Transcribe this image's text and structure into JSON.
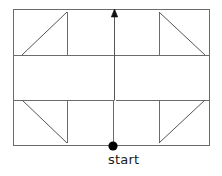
{
  "figure": {
    "kind": "path-diagram",
    "title": "",
    "colors": {
      "stroke": "#6b6b6b",
      "diagonal_stroke": "#555555",
      "marker": "#000000",
      "text": "#1a1a1a",
      "background": "#ffffff"
    },
    "stroke_width": 1,
    "canvas": {
      "width": 222,
      "height": 176
    },
    "bounds": {
      "left": 13,
      "top": 9,
      "right": 210,
      "bottom": 146
    },
    "guides": {
      "upper_horizontal_y": 55,
      "lower_horizontal_y": 100,
      "upper_vertical_x": 114,
      "lower_vertical_x": 113,
      "step_gap_x": 116
    },
    "segments": [
      {
        "name": "outer-rectangle",
        "x": 13,
        "y": 9,
        "width": 197,
        "height": 137
      },
      {
        "name": "upper-horizontal",
        "x1": 13,
        "y1": 55,
        "x2": 210,
        "y2": 55
      },
      {
        "name": "lower-horizontal-left",
        "x1": 13,
        "y1": 100,
        "x2": 114,
        "y2": 100
      },
      {
        "name": "lower-horizontal-right",
        "x1": 116,
        "y1": 100,
        "x2": 210,
        "y2": 100
      },
      {
        "name": "central-vertical-upper",
        "x1": 114,
        "y1": 14,
        "x2": 114,
        "y2": 100
      },
      {
        "name": "central-vertical-lower",
        "x1": 113,
        "y1": 100,
        "x2": 113,
        "y2": 146
      }
    ],
    "triangles": [
      {
        "name": "top-left-triangle",
        "quadrant": "top-left",
        "points": "67,12 67,55 22,55",
        "vertical_edge": {
          "x": 67,
          "y1": 12,
          "y2": 55
        },
        "horizontal_edge": {
          "y": 55,
          "x1": 22,
          "x2": 67
        },
        "hypotenuse": {
          "x1": 67,
          "y1": 12,
          "x2": 22,
          "y2": 55
        }
      },
      {
        "name": "top-right-triangle",
        "quadrant": "top-right",
        "points": "159,12 159,55 205,55",
        "vertical_edge": {
          "x": 159,
          "y1": 12,
          "y2": 55
        },
        "horizontal_edge": {
          "y": 55,
          "x1": 159,
          "x2": 205
        },
        "hypotenuse": {
          "x1": 159,
          "y1": 12,
          "x2": 205,
          "y2": 55
        }
      },
      {
        "name": "bottom-left-triangle",
        "quadrant": "bottom-left",
        "points": "22,100 67,100 67,143",
        "vertical_edge": {
          "x": 67,
          "y1": 100,
          "y2": 143
        },
        "horizontal_edge": {
          "y": 100,
          "x1": 22,
          "x2": 67
        },
        "hypotenuse": {
          "x1": 22,
          "y1": 100,
          "x2": 67,
          "y2": 143
        }
      },
      {
        "name": "bottom-right-triangle",
        "quadrant": "bottom-right",
        "points": "159,100 205,100 159,143",
        "vertical_edge": {
          "x": 159,
          "y1": 100,
          "y2": 143
        },
        "horizontal_edge": {
          "y": 100,
          "x1": 159,
          "x2": 205
        },
        "hypotenuse": {
          "x1": 205,
          "y1": 100,
          "x2": 159,
          "y2": 143
        }
      }
    ],
    "arrow": {
      "name": "direction-arrow",
      "direction": "up",
      "tip_x": 114,
      "tip_y": 10,
      "head_half_width": 3.2,
      "head_length": 7
    },
    "start_marker": {
      "name": "start-point",
      "cx": 113,
      "cy": 146,
      "r": 4.6,
      "label": "start"
    }
  }
}
